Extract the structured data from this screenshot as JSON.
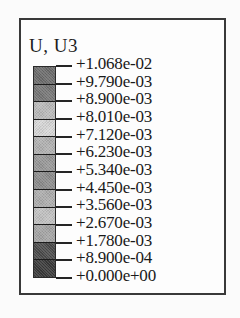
{
  "figure": {
    "title": "U, U3",
    "frame_color": "#3a3a3a",
    "background_color": "#fdfdfd"
  },
  "chart_data": {
    "type": "heatmap",
    "title": "U, U3",
    "subtitle": "",
    "xlabel": "",
    "ylabel": "",
    "legend_position": "standalone",
    "grid": false,
    "colormap": "grayscale-banded",
    "tick_labels": [
      "+1.068e-02",
      "+9.790e-03",
      "+8.900e-03",
      "+8.010e-03",
      "+7.120e-03",
      "+6.230e-03",
      "+5.340e-03",
      "+4.450e-03",
      "+3.560e-03",
      "+2.670e-03",
      "+1.780e-03",
      "+8.900e-04",
      "+0.000e+00"
    ],
    "tick_values": [
      0.01068,
      0.00979,
      0.0089,
      0.00801,
      0.00712,
      0.00623,
      0.00534,
      0.00445,
      0.00356,
      0.00267,
      0.00178,
      0.00089,
      0.0
    ],
    "value_min": 0.0,
    "value_max": 0.01068,
    "band_count": 12,
    "band_colors": [
      "#6e6e6e",
      "#787878",
      "#bdbdbd",
      "#dadada",
      "#b4b4b4",
      "#9a9a9a",
      "#8f8f8f",
      "#b0b0b0",
      "#c4c4c4",
      "#a8a8a8",
      "#4d4d4d",
      "#3b3b3b"
    ],
    "band_ranges": [
      [
        "+9.790e-03",
        "+1.068e-02"
      ],
      [
        "+8.900e-03",
        "+9.790e-03"
      ],
      [
        "+8.010e-03",
        "+8.900e-03"
      ],
      [
        "+7.120e-03",
        "+8.010e-03"
      ],
      [
        "+6.230e-03",
        "+7.120e-03"
      ],
      [
        "+5.340e-03",
        "+6.230e-03"
      ],
      [
        "+4.450e-03",
        "+5.340e-03"
      ],
      [
        "+3.560e-03",
        "+4.450e-03"
      ],
      [
        "+2.670e-03",
        "+3.560e-03"
      ],
      [
        "+1.780e-03",
        "+2.670e-03"
      ],
      [
        "+8.900e-04",
        "+1.780e-03"
      ],
      [
        "+0.000e+00",
        "+8.900e-04"
      ]
    ]
  }
}
